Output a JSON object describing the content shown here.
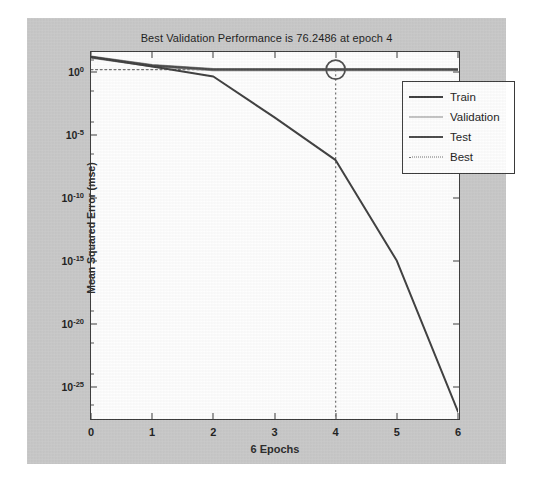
{
  "figure": {
    "background_color": "#c9c9c9",
    "axes_background_color": "#ffffff"
  },
  "title": "Best Validation Performance is 76.2486 at epoch 4",
  "axis": {
    "ylabel": "Mean Squared Error  (mse)",
    "xlabel": "6 Epochs"
  },
  "legend": {
    "items": [
      {
        "label": "Train",
        "color": "#3f3f3f",
        "style": "solid",
        "width": 2.2
      },
      {
        "label": "Validation",
        "color": "#8a8a8a",
        "style": "solid",
        "width": 1.6
      },
      {
        "label": "Test",
        "color": "#4a4a4a",
        "style": "solid",
        "width": 2.2
      },
      {
        "label": "Best",
        "color": "#6e6e6e",
        "style": "dotted",
        "width": 1.3
      }
    ]
  },
  "marker": {
    "name": "best-validation-circle",
    "epoch": 4,
    "value": 76.2486,
    "color": "#4f4f4f"
  },
  "chart_data": {
    "type": "line",
    "title": "Best Validation Performance is 76.2486 at epoch 4",
    "xlabel": "6 Epochs",
    "ylabel": "Mean Squared Error  (mse)",
    "xlim": [
      0,
      6
    ],
    "ylim_log10": [
      -27.5,
      1.6
    ],
    "yscale": "log",
    "grid": false,
    "legend_position": "upper right",
    "xticks": [
      0,
      1,
      2,
      3,
      4,
      5,
      6
    ],
    "xtick_labels": [
      "0",
      "1",
      "2",
      "3",
      "4",
      "5",
      "6"
    ],
    "yticks_log10": [
      0,
      -5,
      -10,
      -15,
      -20,
      -25
    ],
    "ytick_labels": [
      "10^0",
      "10^-5",
      "10^-10",
      "10^-15",
      "10^-20",
      "10^-25"
    ],
    "x": [
      0,
      1,
      2,
      3,
      4,
      5,
      6
    ],
    "series": [
      {
        "name": "Train",
        "color": "#3f3f3f",
        "style": "solid",
        "y_log10": [
          1.2,
          0.45,
          -0.35,
          -3.6,
          -7.0,
          -15.0,
          -27.0
        ]
      },
      {
        "name": "Validation",
        "color": "#8a8a8a",
        "style": "solid",
        "y_log10": [
          1.2,
          0.52,
          0.2,
          0.2,
          0.2,
          0.2,
          0.2
        ]
      },
      {
        "name": "Test",
        "color": "#4a4a4a",
        "style": "solid",
        "y_log10": [
          1.2,
          0.52,
          0.2,
          0.2,
          0.2,
          0.2,
          0.2
        ]
      },
      {
        "name": "Best",
        "color": "#6e6e6e",
        "style": "dotted",
        "description": "horizontal dotted line at best validation mse and vertical dotted line at epoch 4",
        "horizontal_y_log10": 0.2,
        "vertical_x": 4
      }
    ],
    "best_point": {
      "epoch": 4,
      "mse": 76.2486
    }
  },
  "yticks": [
    {
      "mantissa": "10",
      "exponent": "0"
    },
    {
      "mantissa": "10",
      "exponent": "-5"
    },
    {
      "mantissa": "10",
      "exponent": "-10"
    },
    {
      "mantissa": "10",
      "exponent": "-15"
    },
    {
      "mantissa": "10",
      "exponent": "-20"
    },
    {
      "mantissa": "10",
      "exponent": "-25"
    }
  ],
  "xticks": [
    "0",
    "1",
    "2",
    "3",
    "4",
    "5",
    "6"
  ]
}
